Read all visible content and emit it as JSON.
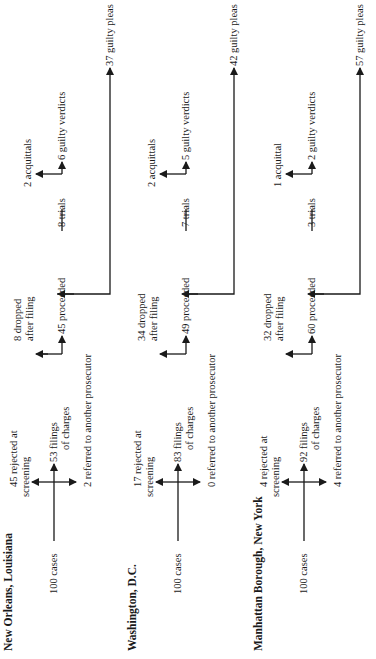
{
  "panels": [
    {
      "title": "New Orleans, Louisiana",
      "start": "100 cases",
      "rejected": [
        "45 rejected at",
        "screening"
      ],
      "filings": [
        "53 filings",
        "of charges"
      ],
      "referred": "2 referred to another prosecutor",
      "dropped": [
        "8 dropped",
        "after filing"
      ],
      "proceeded": "45 proceeded",
      "trials": "8 trials",
      "acquittals": "2 acquittals",
      "verdicts": "6 guilty verdicts",
      "pleas": "37 guilty pleas"
    },
    {
      "title": "Washington, D.C.",
      "start": "100 cases",
      "rejected": [
        "17 rejected at",
        "screening"
      ],
      "filings": [
        "83 filings",
        "of charges"
      ],
      "referred": "0 referred to another prosecutor",
      "dropped": [
        "34 dropped",
        "after filing"
      ],
      "proceeded": "49 proceeded",
      "trials": "7 trials",
      "acquittals": "2 acquittals",
      "verdicts": "5 guilty verdicts",
      "pleas": "42 guilty pleas"
    },
    {
      "title": "Manhattan Borough, New York",
      "start": "100 cases",
      "rejected": [
        "4 rejected at",
        "screening"
      ],
      "filings": [
        "92 filings",
        "of charges"
      ],
      "referred": "4 referred to another prosecutor",
      "dropped": [
        "32 dropped",
        "after filing"
      ],
      "proceeded": "60 proceeded",
      "trials": "3 trials",
      "acquittals": "1 acquittal",
      "verdicts": "2 guilty verdicts",
      "pleas": "57 guilty pleas"
    }
  ]
}
